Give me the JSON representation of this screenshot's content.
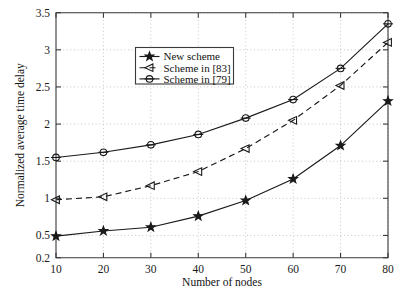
{
  "chart_data": {
    "type": "line",
    "title": "",
    "xlabel": "Number of nodes",
    "ylabel": "Normalized average time delay",
    "x": [
      10,
      20,
      30,
      40,
      50,
      60,
      70,
      80
    ],
    "xticklabels": [
      "10",
      "20",
      "30",
      "40",
      "50",
      "60",
      "70",
      "80"
    ],
    "yticks": [
      0.2,
      0.5,
      1,
      1.5,
      2,
      2.5,
      3,
      3.5
    ],
    "yticklabels": [
      "0.2",
      "0.5",
      "1",
      "1.5",
      "2",
      "2.5",
      "3",
      "3.5"
    ],
    "xlim": [
      10,
      80
    ],
    "ylim": [
      0.2,
      3.5
    ],
    "grid": true,
    "legend_position": "upper center",
    "series": [
      {
        "name": "New scheme",
        "marker": "star",
        "linestyle": "solid",
        "values": [
          0.49,
          0.56,
          0.61,
          0.76,
          0.97,
          1.26,
          1.71,
          2.31
        ]
      },
      {
        "name": "Scheme in [83]",
        "marker": "left-triangle",
        "linestyle": "dashed",
        "values": [
          0.98,
          1.02,
          1.17,
          1.36,
          1.67,
          2.05,
          2.52,
          3.1
        ]
      },
      {
        "name": "Scheme in [79]",
        "marker": "circle",
        "linestyle": "solid",
        "values": [
          1.55,
          1.62,
          1.72,
          1.86,
          2.08,
          2.33,
          2.75,
          3.35
        ]
      }
    ],
    "colors": {
      "line": "#1a1a1a",
      "grid": "#b9b9b9",
      "axis": "#3a3a3a",
      "background": "#ffffff"
    }
  },
  "background_text": {
    "lines": [
      "",
      "",
      "",
      "",
      "",
      ""
    ]
  }
}
